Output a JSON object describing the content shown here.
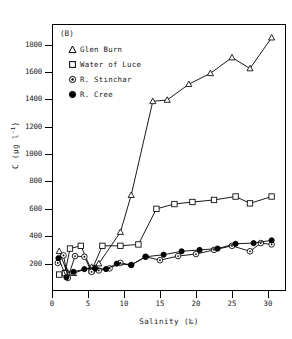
{
  "panel_tag": "(B)",
  "legend": {
    "position": "inside-top-left",
    "entries": [
      {
        "label": "Glen Burn",
        "marker": "triangle-open-marker"
      },
      {
        "label": "Water of Luce",
        "marker": "square-open-marker"
      },
      {
        "label": "R. Stinchar",
        "marker": "circle-dot-marker"
      },
      {
        "label": "R. Cree",
        "marker": "circle-filled-marker"
      }
    ]
  },
  "axes": {
    "x_title": "Salinity (‰)",
    "y_title_main": "C (µg l",
    "y_title_sup": "-1",
    "y_title_tail": ")",
    "x_ticks": [
      0,
      5,
      10,
      15,
      20,
      25,
      30
    ],
    "y_ticks": [
      200,
      400,
      600,
      800,
      1000,
      1200,
      1400,
      1600,
      1800
    ]
  },
  "colors": {
    "line": "#000000",
    "frame": "#000000",
    "background": "#ffffff"
  },
  "chart_data": {
    "type": "line",
    "title": "(B)",
    "xlabel": "Salinity (‰)",
    "ylabel": "C (µg l-1)",
    "xlim": [
      0,
      32.5
    ],
    "ylim": [
      0,
      1950
    ],
    "grid": false,
    "legend_position": "inside-top-left",
    "series": [
      {
        "name": "Glen Burn",
        "marker": "triangle-open-marker",
        "x": [
          1.0,
          2.0,
          3.0,
          5.5,
          6.5,
          9.5,
          11.0,
          14.0,
          16.0,
          19.0,
          22.0,
          25.0,
          27.5,
          30.5
        ],
        "y": [
          290,
          150,
          130,
          175,
          200,
          430,
          700,
          1385,
          1395,
          1510,
          1590,
          1705,
          1625,
          1850
        ]
      },
      {
        "name": "Water of Luce",
        "marker": "square-open-marker",
        "x": [
          1.0,
          1.8,
          2.5,
          4.0,
          5.5,
          7.0,
          9.5,
          12.0,
          14.5,
          17.0,
          19.5,
          22.5,
          25.5,
          27.5,
          30.5
        ],
        "y": [
          120,
          130,
          310,
          330,
          150,
          330,
          330,
          340,
          600,
          635,
          650,
          665,
          690,
          640,
          690
        ]
      },
      {
        "name": "R. Stinchar",
        "marker": "circle-dot-marker",
        "x": [
          0.8,
          1.6,
          2.2,
          3.2,
          4.5,
          5.5,
          6.5,
          8.0,
          9.5,
          11.0,
          13.0,
          15.0,
          17.5,
          20.0,
          22.5,
          25.0,
          27.5,
          29.0,
          30.5
        ],
        "y": [
          205,
          260,
          95,
          255,
          250,
          140,
          150,
          165,
          205,
          190,
          250,
          225,
          255,
          270,
          300,
          330,
          290,
          350,
          340
        ]
      },
      {
        "name": "R. Cree",
        "marker": "circle-filled-marker",
        "x": [
          0.9,
          2.0,
          3.0,
          4.5,
          6.0,
          7.5,
          9.0,
          11.0,
          13.0,
          15.5,
          18.0,
          20.5,
          23.0,
          25.5,
          28.0,
          30.5
        ],
        "y": [
          240,
          100,
          140,
          160,
          165,
          160,
          200,
          190,
          250,
          265,
          290,
          300,
          310,
          345,
          350,
          370
        ]
      }
    ]
  }
}
